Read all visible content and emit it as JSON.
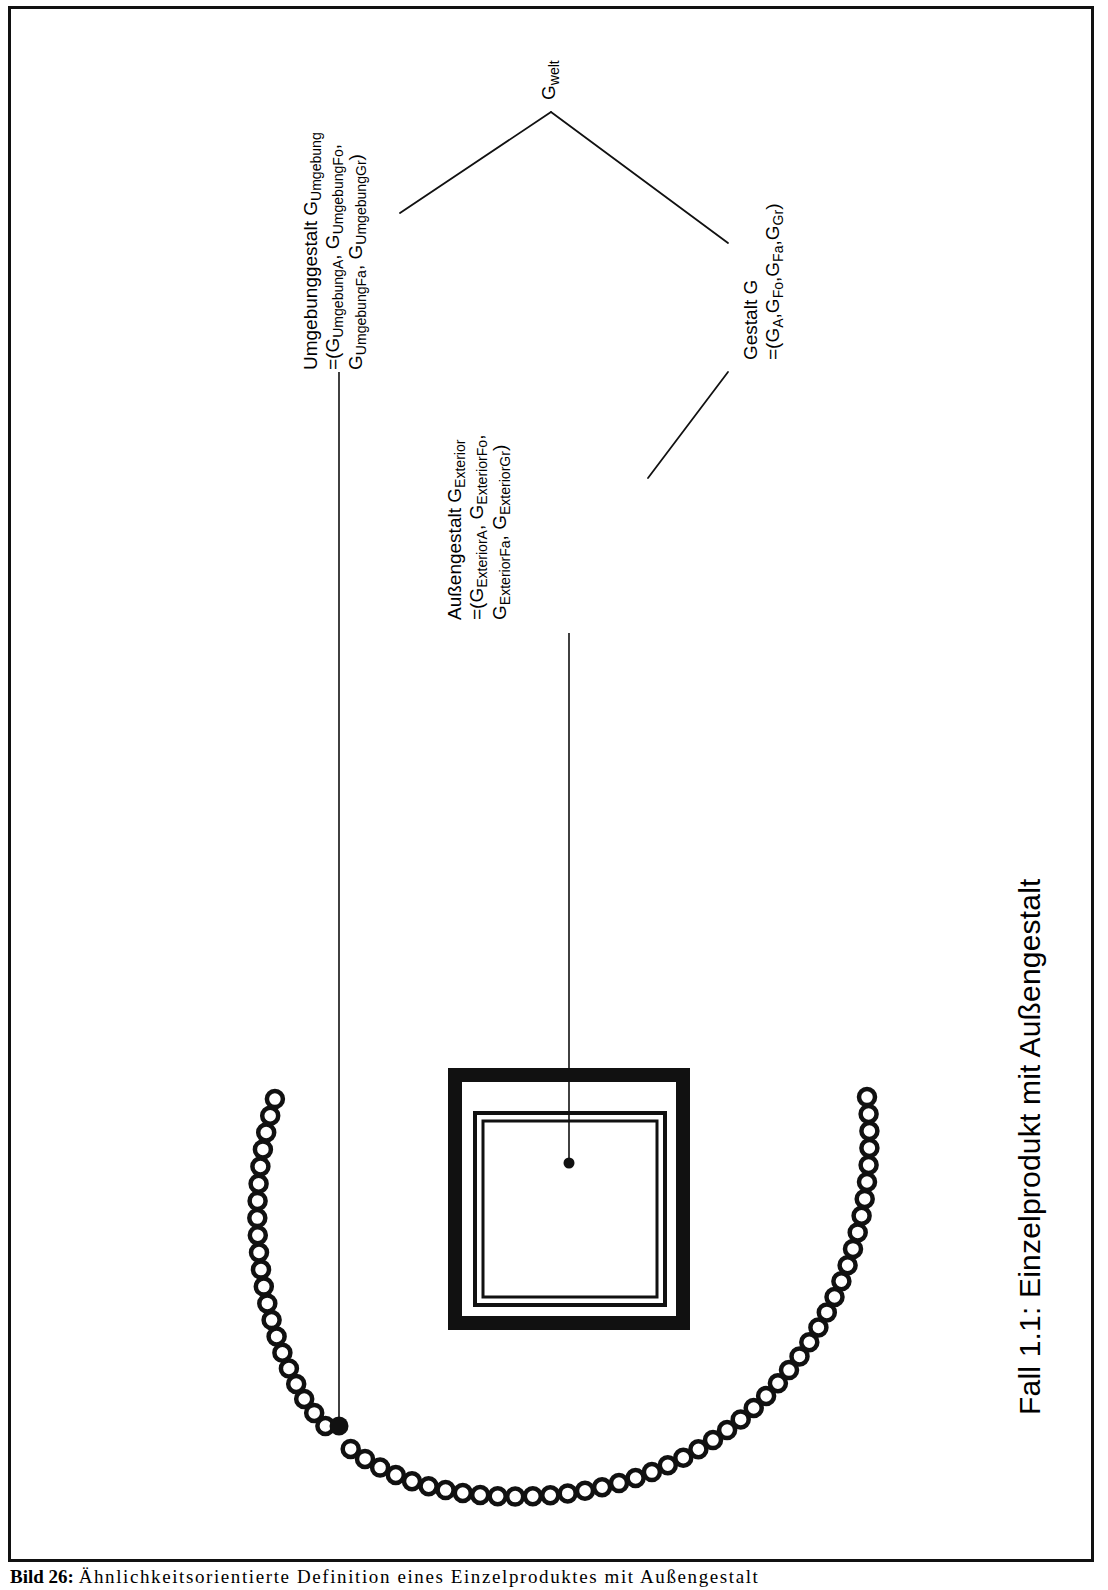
{
  "figure": {
    "side_caption": "Fall 1.1: Einzelprodukt mit Außengestalt",
    "bottom_caption_number": "Bild 26:",
    "bottom_caption_text": "Ähnlichkeitsorientierte Definition eines Einzelproduktes mit Außengestalt",
    "background_color": "#ffffff",
    "line_color": "#111111"
  },
  "nodes": {
    "welt": {
      "label_main": "G",
      "label_sub": "welt"
    },
    "umgebung": {
      "line1_a": "Umgebunggestalt G",
      "line1_sub": "Umgebung",
      "line2": "=(G",
      "line2_sub1": "Umgebung",
      "line2_subsub1": "A",
      "line2_b": ", G",
      "line2_sub2": "Umgebung",
      "line2_subsub2": "Fo",
      "line2_c": ",",
      "line3_a": "G",
      "line3_sub1": "Umgebung",
      "line3_subsub1": "Fa",
      "line3_b": ", G",
      "line3_sub2": "Umgebung",
      "line3_subsub2": "Gr",
      "line3_c": ")"
    },
    "gestalt": {
      "line1": "Gestalt G",
      "line2_a": "=(G",
      "line2_sub1": "A",
      "line2_b": ",G",
      "line2_sub2": "Fo",
      "line2_c": ",G",
      "line2_sub3": "Fa",
      "line2_d": ",G",
      "line2_sub4": "Gr",
      "line2_e": ")"
    },
    "exterior": {
      "line1_a": "Außengestalt G",
      "line1_sub": "Exterior",
      "line2_a": "=(G",
      "line2_sub1": "Exterior",
      "line2_subsub1": "A",
      "line2_b": ", G",
      "line2_sub2": "Exterior",
      "line2_subsub2": "Fo",
      "line2_c": ",",
      "line3_a": "G",
      "line3_sub1": "Exterior",
      "line3_subsub1": "Fa",
      "line3_b": ", G",
      "line3_sub2": "Exterior",
      "line3_subsub2": "Gr",
      "line3_c": ")"
    }
  },
  "shapes": {
    "product_square_name": "Einzelprodukt",
    "environment_arc_name": "Umgebung",
    "arc_open_circle_count": 57,
    "arc_filled_circle_index": 12
  }
}
